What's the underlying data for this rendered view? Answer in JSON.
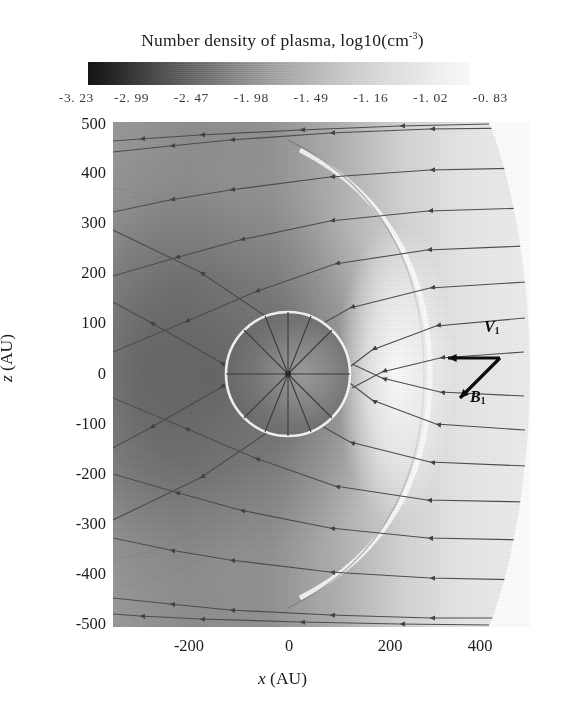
{
  "figure": {
    "colorbar_title_main": "Number  density of plasma, log10(cm",
    "colorbar_title_exp": "-3",
    "colorbar_title_tail": ")"
  },
  "chart_data": {
    "type": "heatmap",
    "subtitle": "",
    "xlabel": "x (AU)",
    "ylabel": "z (AU)",
    "xlim": [
      -390,
      540
    ],
    "ylim": [
      -500,
      500
    ],
    "xticks": [
      -200,
      0,
      200,
      400
    ],
    "xticklabels": [
      "-200",
      "0",
      "200",
      "400"
    ],
    "yticks": [
      500,
      400,
      300,
      200,
      100,
      0,
      -100,
      -200,
      -300,
      -400,
      -500
    ],
    "yticklabels": [
      "500",
      "400",
      "300",
      "200",
      "100",
      "0",
      "-100",
      "-200",
      "-300",
      "-400",
      "-500"
    ],
    "grid": false,
    "legend": "none",
    "colorbar": {
      "orientation": "horizontal",
      "position": "top",
      "colormap": "grayscale-dark-to-light",
      "tick_values": [
        -3.23,
        -2.99,
        -2.47,
        -1.98,
        -1.49,
        -1.16,
        -1.02,
        -0.83
      ],
      "tick_labels": [
        "-3. 23",
        "-2. 99",
        "-2. 47",
        "-1. 98",
        "-1. 49",
        "-1. 16",
        "-1. 02",
        "-0. 83"
      ],
      "units": "log10(cm^-3)",
      "vmin": -3.23,
      "vmax": -0.83
    },
    "annotations": [
      {
        "name": "velocity-vector",
        "label": "V",
        "sublabel": "1",
        "direction": "left",
        "tail_au": [
          530,
          20
        ],
        "head_au": [
          360,
          20
        ]
      },
      {
        "name": "magnetic-field-vector",
        "label": "B",
        "sublabel": "1",
        "direction": "down-left",
        "tail_au": [
          530,
          20
        ],
        "head_au": [
          400,
          -90
        ]
      }
    ],
    "features": [
      {
        "name": "termination-shock",
        "shape": "circle",
        "center_au": [
          0,
          0
        ],
        "radius_au": 150
      },
      {
        "name": "heliopause",
        "shape": "arc",
        "note": "bright narrow ridge wrapping the dayside, opening toward -x"
      },
      {
        "name": "bow-shock",
        "shape": "arc",
        "note": "outer curved density enhancement on the -x side"
      },
      {
        "name": "streamlines",
        "count": 22,
        "flow_direction": "right-to-left",
        "note": "incoming flow from +x deflected around the obstacle, arrowheads point toward -x"
      }
    ]
  },
  "colorbar_ticks": [
    {
      "value": -3.23,
      "label": "-3. 23",
      "pos_pct": 4
    },
    {
      "value": -2.99,
      "label": "-2. 99",
      "pos_pct": 16
    },
    {
      "value": -2.47,
      "label": "-2. 47",
      "pos_pct": 29
    },
    {
      "value": -1.98,
      "label": "-1. 98",
      "pos_pct": 42
    },
    {
      "value": -1.49,
      "label": "-1. 49",
      "pos_pct": 55
    },
    {
      "value": -1.16,
      "label": "-1. 16",
      "pos_pct": 68
    },
    {
      "value": -1.02,
      "label": "-1. 02",
      "pos_pct": 81
    },
    {
      "value": -0.83,
      "label": "-0. 83",
      "pos_pct": 94
    }
  ],
  "y_ticks": [
    {
      "label": "500",
      "y": 124
    },
    {
      "label": "400",
      "y": 173
    },
    {
      "label": "300",
      "y": 223
    },
    {
      "label": "200",
      "y": 273
    },
    {
      "label": "100",
      "y": 323
    },
    {
      "label": "0",
      "y": 374
    },
    {
      "label": "-100",
      "y": 424
    },
    {
      "label": "-200",
      "y": 474
    },
    {
      "label": "-300",
      "y": 524
    },
    {
      "label": "-400",
      "y": 574
    },
    {
      "label": "-500",
      "y": 624
    }
  ],
  "x_ticks": [
    {
      "label": "-200",
      "x": 189
    },
    {
      "label": "0",
      "x": 289
    },
    {
      "label": "200",
      "x": 390
    },
    {
      "label": "400",
      "x": 480
    }
  ],
  "axis_titles": {
    "x_italic": "x",
    "x_rest": " (AU)",
    "y_italic": "z",
    "y_rest": " (AU)"
  },
  "vectors": {
    "v_label": "V",
    "v_sub": "1",
    "b_label": "B",
    "b_sub": "1"
  }
}
